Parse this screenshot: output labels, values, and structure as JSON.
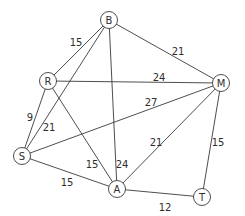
{
  "diagram": {
    "type": "weighted-undirected-graph",
    "node_radius": 8.5,
    "nodes": [
      {
        "id": "B",
        "label": "B",
        "x": 109,
        "y": 20
      },
      {
        "id": "R",
        "label": "R",
        "x": 48,
        "y": 81
      },
      {
        "id": "M",
        "label": "M",
        "x": 221,
        "y": 83
      },
      {
        "id": "S",
        "label": "S",
        "x": 22,
        "y": 156
      },
      {
        "id": "A",
        "label": "A",
        "x": 117,
        "y": 189
      },
      {
        "id": "T",
        "label": "T",
        "x": 202,
        "y": 197
      }
    ],
    "edges": [
      {
        "from": "B",
        "to": "R",
        "weight": "15",
        "lx": 76,
        "ly": 42
      },
      {
        "from": "B",
        "to": "S",
        "weight": "21",
        "lx": 49,
        "ly": 127
      },
      {
        "from": "B",
        "to": "M",
        "weight": "21",
        "lx": 178,
        "ly": 51
      },
      {
        "from": "B",
        "to": "A",
        "weight": "24",
        "lx": 122,
        "ly": 164
      },
      {
        "from": "R",
        "to": "M",
        "weight": "24",
        "lx": 159,
        "ly": 77
      },
      {
        "from": "R",
        "to": "S",
        "weight": "9",
        "lx": 30,
        "ly": 117
      },
      {
        "from": "R",
        "to": "A",
        "weight": "15",
        "lx": 92,
        "ly": 164
      },
      {
        "from": "S",
        "to": "M",
        "weight": "27",
        "lx": 151,
        "ly": 102
      },
      {
        "from": "S",
        "to": "A",
        "weight": "15",
        "lx": 67,
        "ly": 182
      },
      {
        "from": "A",
        "to": "M",
        "weight": "21",
        "lx": 156,
        "ly": 142
      },
      {
        "from": "A",
        "to": "T",
        "weight": "12",
        "lx": 165,
        "ly": 207
      },
      {
        "from": "M",
        "to": "T",
        "weight": "15",
        "lx": 218,
        "ly": 142
      }
    ]
  }
}
